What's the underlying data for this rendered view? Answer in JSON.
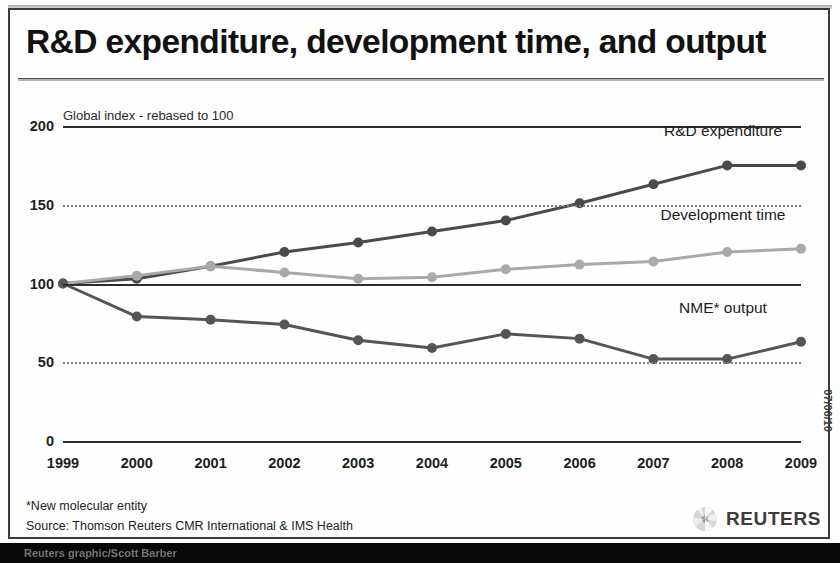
{
  "title": "R&D expenditure, development time, and output",
  "subtitle": "Global index - rebased to 100",
  "date_stamp": "07/06/10",
  "footnotes": {
    "note": "*New molecular entity",
    "source": "Source: Thomson Reuters CMR International & IMS Health"
  },
  "logo": {
    "name": "REUTERS"
  },
  "bottom_bar": {
    "credit": "Reuters graphic/Scott Barber"
  },
  "axis": {
    "y_ticks": [
      "0",
      "50",
      "100",
      "150",
      "200"
    ],
    "x_ticks": [
      "1999",
      "2000",
      "2001",
      "2002",
      "2003",
      "2004",
      "2005",
      "2006",
      "2007",
      "2008",
      "2009"
    ]
  },
  "series_labels": {
    "rnd": "R&D expenditure",
    "devtime": "Development time",
    "nme": "NME* output"
  },
  "colors": {
    "rnd": "#4a4a4a",
    "devtime": "#a9a9a9",
    "nme": "#555555",
    "axis": "#2d2d2d",
    "grid": "#7e7e7e"
  },
  "chart_data": {
    "type": "line",
    "title": "R&D expenditure, development time, and output",
    "subtitle": "Global index - rebased to 100",
    "xlabel": "",
    "ylabel": "Global index - rebased to 100",
    "ylim": [
      0,
      200
    ],
    "yticks": [
      0,
      50,
      100,
      150,
      200
    ],
    "grid": "horizontal dotted at 50 and 150; solid at 0, 100 and 200",
    "legend": "inline labels at right of each series",
    "x": [
      "1999",
      "2000",
      "2001",
      "2002",
      "2003",
      "2004",
      "2005",
      "2006",
      "2007",
      "2008",
      "2009"
    ],
    "series": [
      {
        "name": "R&D expenditure",
        "color": "#4a4a4a",
        "values": [
          100,
          103,
          111,
          120,
          126,
          133,
          140,
          151,
          163,
          175,
          175
        ]
      },
      {
        "name": "Development time",
        "color": "#a9a9a9",
        "values": [
          100,
          105,
          111,
          107,
          103,
          104,
          109,
          112,
          114,
          120,
          122
        ]
      },
      {
        "name": "NME* output",
        "color": "#555555",
        "values": [
          100,
          79,
          77,
          74,
          64,
          59,
          68,
          65,
          52,
          52,
          63
        ]
      }
    ],
    "annotations": [
      "*New molecular entity",
      "Source: Thomson Reuters CMR International & IMS Health"
    ]
  }
}
